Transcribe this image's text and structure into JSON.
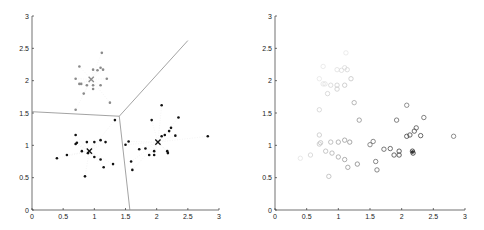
{
  "chart_data": [
    {
      "type": "scatter",
      "title": "",
      "xlabel": "",
      "ylabel": "",
      "xlim": [
        0,
        3
      ],
      "ylim": [
        0,
        3
      ],
      "x_ticks": [
        "0",
        "0.5",
        "1",
        "1.5",
        "2",
        "2.5",
        "3"
      ],
      "y_ticks": [
        "0",
        "0.5",
        "1",
        "1.5",
        "2",
        "2.5",
        "3"
      ],
      "grid": false,
      "legend": null,
      "series": [
        {
          "name": "cluster-upper",
          "marker": "dot",
          "color": "#8a8a8a",
          "points": [
            [
              0.7,
              1.55
            ],
            [
              0.7,
              2.03
            ],
            [
              0.76,
              2.22
            ],
            [
              0.76,
              1.95
            ],
            [
              0.79,
              1.95
            ],
            [
              0.83,
              1.8
            ],
            [
              0.88,
              1.93
            ],
            [
              0.98,
              1.87
            ],
            [
              0.98,
              1.93
            ],
            [
              0.98,
              2.17
            ],
            [
              1.05,
              2.16
            ],
            [
              1.1,
              2.2
            ],
            [
              1.12,
              2.43
            ],
            [
              1.14,
              2.17
            ],
            [
              1.1,
              1.93
            ],
            [
              1.2,
              2.03
            ],
            [
              1.25,
              1.66
            ]
          ]
        },
        {
          "name": "cluster-lower-left",
          "marker": "dot",
          "color": "#111111",
          "points": [
            [
              0.4,
              0.8
            ],
            [
              0.56,
              0.85
            ],
            [
              0.7,
              1.02
            ],
            [
              0.72,
              1.04
            ],
            [
              0.7,
              1.16
            ],
            [
              0.8,
              0.91
            ],
            [
              0.85,
              0.52
            ],
            [
              0.88,
              1.05
            ],
            [
              0.9,
              0.88
            ],
            [
              1.0,
              1.05
            ],
            [
              1.0,
              0.82
            ],
            [
              1.1,
              1.08
            ],
            [
              1.1,
              0.78
            ],
            [
              1.15,
              0.66
            ],
            [
              1.18,
              1.05
            ],
            [
              1.3,
              0.71
            ],
            [
              1.33,
              1.39
            ]
          ]
        },
        {
          "name": "cluster-right",
          "marker": "dot",
          "color": "#111111",
          "points": [
            [
              1.5,
              1.01
            ],
            [
              1.55,
              1.06
            ],
            [
              1.59,
              0.75
            ],
            [
              1.61,
              0.62
            ],
            [
              1.72,
              0.94
            ],
            [
              1.82,
              0.95
            ],
            [
              1.88,
              0.85
            ],
            [
              1.92,
              1.39
            ],
            [
              1.96,
              0.91
            ],
            [
              1.96,
              0.85
            ],
            [
              2.08,
              1.14
            ],
            [
              2.08,
              1.62
            ],
            [
              2.13,
              1.16
            ],
            [
              2.17,
              0.91
            ],
            [
              2.18,
              0.88
            ],
            [
              2.2,
              1.22
            ],
            [
              2.23,
              1.27
            ],
            [
              2.3,
              1.15
            ],
            [
              2.35,
              1.43
            ],
            [
              2.82,
              1.14
            ]
          ]
        }
      ],
      "centroids": [
        {
          "x": 0.95,
          "y": 2.02,
          "marker": "x",
          "color": "#8a8a8a"
        },
        {
          "x": 0.92,
          "y": 0.91,
          "marker": "x",
          "color": "#111111"
        },
        {
          "x": 2.02,
          "y": 1.05,
          "marker": "x",
          "color": "#111111"
        }
      ],
      "boundaries": [
        {
          "from": [
            1.4,
            1.45
          ],
          "to": [
            0,
            1.52
          ]
        },
        {
          "from": [
            1.4,
            1.45
          ],
          "to": [
            2.5,
            2.62
          ]
        },
        {
          "from": [
            1.4,
            1.45
          ],
          "to": [
            1.57,
            0
          ]
        }
      ]
    },
    {
      "type": "scatter",
      "title": "",
      "xlabel": "",
      "ylabel": "",
      "xlim": [
        0,
        3
      ],
      "ylim": [
        0,
        3
      ],
      "x_ticks": [
        "0",
        "0.5",
        "1",
        "1.5",
        "2",
        "2.5",
        "3"
      ],
      "y_ticks": [
        "0",
        "0.5",
        "1",
        "1.5",
        "2",
        "2.5",
        "3"
      ],
      "grid": false,
      "legend": null,
      "series": [
        {
          "name": "all-points-shaded",
          "marker": "circle-open",
          "points": [
            [
              0.7,
              1.55
            ],
            [
              0.7,
              2.03
            ],
            [
              0.76,
              2.22
            ],
            [
              0.76,
              1.95
            ],
            [
              0.79,
              1.95
            ],
            [
              0.83,
              1.8
            ],
            [
              0.88,
              1.93
            ],
            [
              0.98,
              1.87
            ],
            [
              0.98,
              1.93
            ],
            [
              0.98,
              2.17
            ],
            [
              1.05,
              2.16
            ],
            [
              1.1,
              2.2
            ],
            [
              1.12,
              2.43
            ],
            [
              1.14,
              2.17
            ],
            [
              1.1,
              1.93
            ],
            [
              1.2,
              2.03
            ],
            [
              1.25,
              1.66
            ],
            [
              0.4,
              0.8
            ],
            [
              0.56,
              0.85
            ],
            [
              0.7,
              1.02
            ],
            [
              0.72,
              1.04
            ],
            [
              0.7,
              1.16
            ],
            [
              0.8,
              0.91
            ],
            [
              0.85,
              0.52
            ],
            [
              0.88,
              1.05
            ],
            [
              0.9,
              0.88
            ],
            [
              1.0,
              1.05
            ],
            [
              1.0,
              0.82
            ],
            [
              1.1,
              1.08
            ],
            [
              1.1,
              0.78
            ],
            [
              1.15,
              0.66
            ],
            [
              1.18,
              1.05
            ],
            [
              1.3,
              0.71
            ],
            [
              1.33,
              1.39
            ],
            [
              1.5,
              1.01
            ],
            [
              1.55,
              1.06
            ],
            [
              1.59,
              0.75
            ],
            [
              1.61,
              0.62
            ],
            [
              1.72,
              0.94
            ],
            [
              1.82,
              0.95
            ],
            [
              1.88,
              0.85
            ],
            [
              1.92,
              1.39
            ],
            [
              1.96,
              0.91
            ],
            [
              1.96,
              0.85
            ],
            [
              2.08,
              1.14
            ],
            [
              2.08,
              1.62
            ],
            [
              2.13,
              1.16
            ],
            [
              2.17,
              0.91
            ],
            [
              2.18,
              0.88
            ],
            [
              2.2,
              1.22
            ],
            [
              2.23,
              1.27
            ],
            [
              2.3,
              1.15
            ],
            [
              2.35,
              1.43
            ],
            [
              2.82,
              1.14
            ]
          ],
          "shade_reference": [
            2.17,
            0.9
          ]
        }
      ]
    }
  ]
}
